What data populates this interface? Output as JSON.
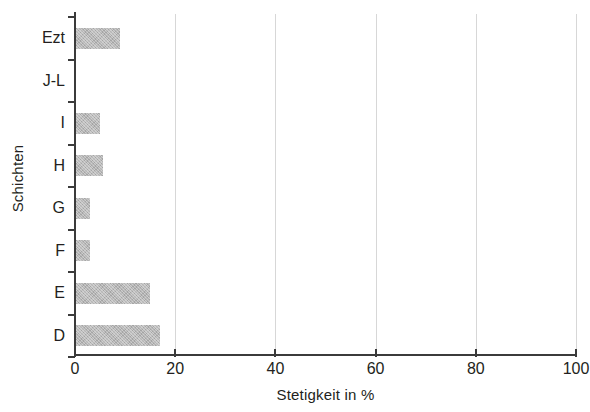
{
  "chart_data": {
    "type": "bar",
    "orientation": "horizontal",
    "title": "",
    "xlabel": "Stetigkeit in %",
    "ylabel": "Schichten",
    "xlim": [
      0,
      100
    ],
    "xticks": [
      0,
      20,
      40,
      60,
      80,
      100
    ],
    "xtick_labels": [
      "0",
      "20",
      "40",
      "60",
      "80",
      "100"
    ],
    "grid": "vertical",
    "legend": "none",
    "bar_color": "#b6b6b6",
    "axis_color": "#3b3b3b",
    "gridline_color": "#d7d7d7",
    "categories": [
      "Ezt",
      "J-L",
      "I",
      "H",
      "G",
      "F",
      "E",
      "D"
    ],
    "values": [
      9,
      0,
      5,
      5.5,
      3,
      3,
      15,
      17
    ]
  }
}
